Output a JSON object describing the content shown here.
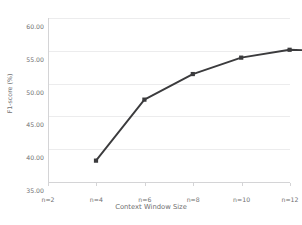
{
  "chart_data": {
    "type": "line",
    "title": "",
    "xlabel": "Context Window Size",
    "ylabel": "F1-score (%)",
    "categories": [
      "n=2",
      "n=4",
      "n=6",
      "n=8",
      "n=10",
      "n=12"
    ],
    "x": [
      2,
      4,
      6,
      8,
      10,
      12
    ],
    "values": [
      41.0,
      50.3,
      54.2,
      56.7,
      57.9,
      57.7
    ],
    "series": [
      {
        "name": "F1-score",
        "values": [
          41.0,
          50.3,
          54.2,
          56.7,
          57.9,
          57.7
        ]
      }
    ],
    "ylim": [
      35.0,
      60.0
    ],
    "yticks": [
      35.0,
      40.0,
      45.0,
      50.0,
      55.0,
      60.0
    ],
    "ytick_labels": [
      "35.00",
      "40.00",
      "45.00",
      "50.00",
      "55.00",
      "60.00"
    ],
    "xtick_labels": [
      "n=2",
      "n=4",
      "n=6",
      "n=8",
      "n=10",
      "n=12"
    ],
    "grid": true,
    "legend": "none",
    "line_color": "#3b3b3d",
    "marker": "square",
    "marker_color": "#3b3b3d",
    "grid_color": "#ececed",
    "axis_color": "#d4d4d6",
    "text_color": "#6f6f70",
    "background": "#ffffff"
  }
}
